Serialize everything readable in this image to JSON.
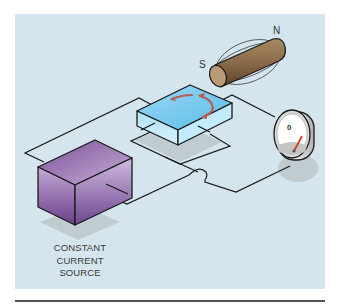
{
  "figure": {
    "source_label": [
      "CONSTANT",
      "CURRENT",
      "SOURCE"
    ],
    "magnet": {
      "south_label": "S",
      "north_label": "N"
    },
    "meter": {
      "reading_label": "0"
    },
    "colors": {
      "panel": "#d5e5ed",
      "source_box": "#8a63a8",
      "hall_plate": "#8fd3f0",
      "magnet": "#8a6a48",
      "current_arrows": "#b0605a",
      "needle": "#d04020",
      "wire": "#1a1a1a"
    }
  }
}
